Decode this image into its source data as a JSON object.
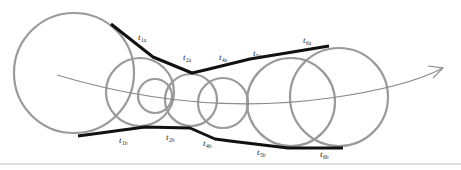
{
  "diagram": {
    "colors": {
      "circle_stroke": "#9a9a9a",
      "tangent_stroke": "#111111",
      "axis_stroke": "#8a8a8a",
      "rule": "#c4c4c4"
    },
    "circles": [
      {
        "id": "c1",
        "cx": 74,
        "cy": 73,
        "r": 60
      },
      {
        "id": "c2",
        "cx": 140,
        "cy": 92,
        "r": 34
      },
      {
        "id": "c3",
        "cx": 155,
        "cy": 96,
        "r": 17
      },
      {
        "id": "c4",
        "cx": 191,
        "cy": 100,
        "r": 26
      },
      {
        "id": "c5",
        "cx": 223,
        "cy": 103,
        "r": 25
      },
      {
        "id": "c6",
        "cx": 291,
        "cy": 102,
        "r": 44
      },
      {
        "id": "c7",
        "cx": 339,
        "cy": 97,
        "r": 49
      }
    ],
    "upper_tangent": "111,24 153,57 192,73 205,70 250,59 329,46",
    "lower_tangent": "78,136 145,127 190,128 215,139 230,141 288,148 343,148",
    "axis_path": "M57,75 C140,100 230,112 330,98 C380,91 420,80 443,68",
    "arrowhead": "428,66 443,68 433,78",
    "labels": {
      "upper": [
        {
          "main": "t",
          "sub": "1a",
          "x": 138,
          "y": 40
        },
        {
          "main": "t",
          "sub": "2a",
          "x": 183,
          "y": 60
        },
        {
          "main": "t",
          "sub": "4a",
          "x": 219,
          "y": 60
        },
        {
          "main": "t",
          "sub": "5a",
          "x": 253,
          "y": 56
        },
        {
          "main": "t",
          "sub": "6a",
          "x": 303,
          "y": 43
        }
      ],
      "lower": [
        {
          "main": "t",
          "sub": "1b",
          "x": 119,
          "y": 143
        },
        {
          "main": "t",
          "sub": "2b",
          "x": 166,
          "y": 140
        },
        {
          "main": "t",
          "sub": "4b",
          "x": 203,
          "y": 146
        },
        {
          "main": "t",
          "sub": "5b",
          "x": 257,
          "y": 155
        },
        {
          "main": "t",
          "sub": "6b",
          "x": 320,
          "y": 157
        }
      ]
    }
  }
}
